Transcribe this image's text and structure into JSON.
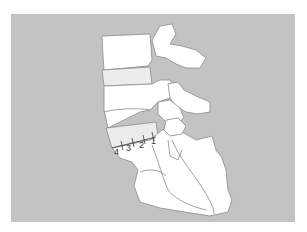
{
  "figure": {
    "background_color": "#c3c3c3",
    "bone_color": "#ffffff",
    "disc_color": "#ececec",
    "outline_color": "#8a8a8a",
    "markers": [
      {
        "label": "1"
      },
      {
        "label": "2"
      },
      {
        "label": "3"
      },
      {
        "label": "4"
      }
    ]
  }
}
